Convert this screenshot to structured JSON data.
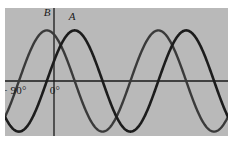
{
  "figure": {
    "panel": {
      "background_color": "#b9b9b9",
      "x": 5,
      "y": 8,
      "width": 223,
      "height": 128
    },
    "page_background_color": "#ffffff"
  },
  "axes": {
    "axis_color": "#1a1a1a",
    "axis_line_width": 1.3,
    "horizontal_axis": {
      "name": "x-axis",
      "y_px": 73
    },
    "vertical_axis": {
      "name": "y-axis",
      "x_px": 49
    },
    "tick_labels": [
      {
        "name": "tick-label-neg90",
        "text": "− 90°",
        "x_deg": -90
      },
      {
        "name": "tick-label-zero",
        "text": "0°",
        "x_deg": 0
      }
    ]
  },
  "curve_labels": [
    {
      "name": "curve-label-a",
      "text": "A"
    },
    {
      "name": "curve-label-b",
      "text": "B"
    }
  ],
  "chart_data": {
    "type": "line",
    "xlabel": "",
    "ylabel": "",
    "grid": false,
    "legend": "inline curve labels A and B near their first maxima",
    "xlim": [
      -135,
      585
    ],
    "ylim": [
      -1.15,
      1.15
    ],
    "x_tick_labels": [
      "− 90°",
      "0°"
    ],
    "x_ticks_deg": [
      -90,
      0
    ],
    "series": [
      {
        "name": "A",
        "label": "A",
        "color": "#1c1c1c",
        "line_width": 2.6,
        "form": "sin",
        "amplitude": 1.0,
        "period_deg": 360,
        "phase_deg": 0,
        "description": "sine curve, zero at 0° rising, maximum at 90°, minimum at 270°",
        "maxima_deg": [
          90,
          450
        ],
        "minima_deg": [
          -90,
          270
        ],
        "zeros_deg": [
          0,
          180,
          360,
          540
        ]
      },
      {
        "name": "B",
        "label": "B",
        "color": "#3a3a3a",
        "line_width": 2.4,
        "form": "cos",
        "amplitude": 1.0,
        "period_deg": 360,
        "phase_deg": 90,
        "description": "cosine curve, maximum at 0°, leading curve A by 90°",
        "maxima_deg": [
          0,
          360
        ],
        "minima_deg": [
          180,
          540
        ],
        "zeros_deg": [
          -90,
          90,
          270,
          450
        ]
      }
    ]
  }
}
